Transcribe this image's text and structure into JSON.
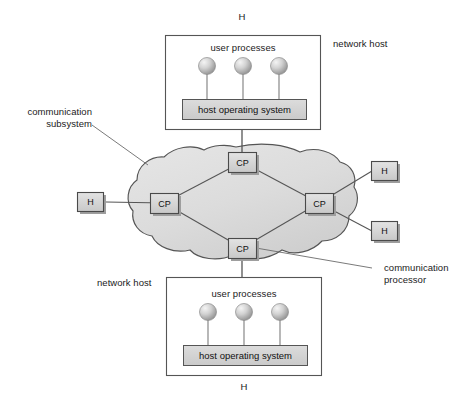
{
  "figure": {
    "background": "#ffffff"
  },
  "colors": {
    "stroke": "#4a4a4a",
    "box_fill": "#ffffff",
    "node_fill": "#d6d6d6",
    "cloud_fill": "#dcdcdc",
    "os_fill": "#d2d2d2",
    "sphere_light": "#f0f0f0",
    "sphere_dark": "#9a9a9a",
    "shadow": "#8a8a8a",
    "text": "#1a1a1a"
  },
  "hosts": {
    "top": {
      "outer_label": "network host",
      "terminal_label": "H",
      "processes_label": "user processes",
      "os_label": "host operating system",
      "process_count": 3
    },
    "bottom": {
      "outer_label": "network host",
      "terminal_label": "H",
      "processes_label": "user processes",
      "os_label": "host operating system",
      "process_count": 3
    }
  },
  "subsystem": {
    "label_line1": "communication",
    "label_line2": "subsystem",
    "processor_label_line1": "communication",
    "processor_label_line2": "processor",
    "nodes": [
      {
        "id": "cp-top",
        "label": "CP",
        "x": 242,
        "y": 162
      },
      {
        "id": "cp-left",
        "label": "CP",
        "x": 164,
        "y": 203
      },
      {
        "id": "cp-right",
        "label": "CP",
        "x": 319,
        "y": 203
      },
      {
        "id": "cp-bottom",
        "label": "CP",
        "x": 242,
        "y": 248
      }
    ],
    "links": [
      [
        "cp-top",
        "cp-left"
      ],
      [
        "cp-top",
        "cp-right"
      ],
      [
        "cp-left",
        "cp-bottom"
      ],
      [
        "cp-right",
        "cp-bottom"
      ]
    ]
  },
  "terminals": [
    {
      "id": "h-left",
      "label": "H",
      "x": 91,
      "y": 202,
      "connects_to": "cp-left"
    },
    {
      "id": "h-right-upper",
      "label": "H",
      "x": 384,
      "y": 171,
      "connects_to": "cp-right"
    },
    {
      "id": "h-right-lower",
      "label": "H",
      "x": 384,
      "y": 231,
      "connects_to": "cp-right"
    }
  ]
}
